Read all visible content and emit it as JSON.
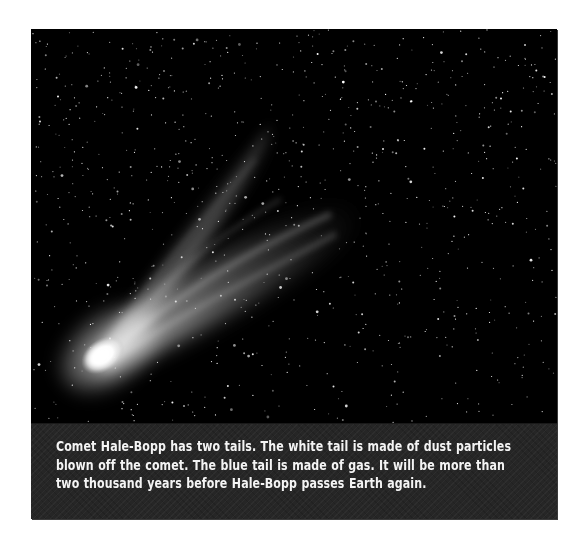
{
  "figure": {
    "subject": "Comet Hale-Bopp",
    "caption": "Comet Hale-Bopp has two tails.  The white tail is made of dust particles\nblown off the comet.  The blue tail is made of gas.  It will be more than\ntwo thousand years before Hale-Bopp passes Earth again."
  },
  "photo": {
    "description": "Grayscale photograph of a comet with a bright nucleus at lower left and two diverging tails streaming toward the upper right against a dense star field",
    "background_color": "#000000",
    "nucleus_color": "#ffffff",
    "tail_color": "#d8d8d8",
    "star_color": "#ffffff",
    "star_count": 900,
    "star_seed": 1997
  },
  "caption_box": {
    "background_color": "#262626",
    "text_color": "#f4f4f4"
  }
}
